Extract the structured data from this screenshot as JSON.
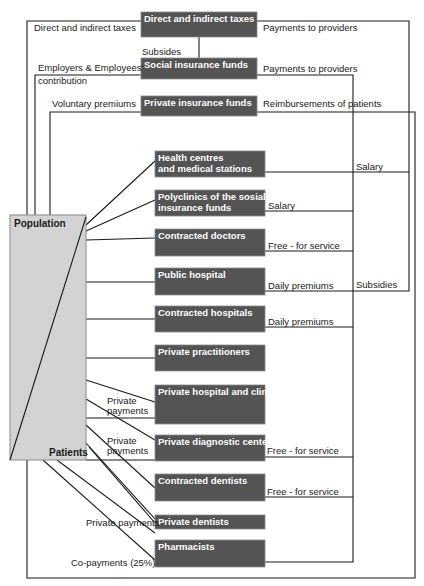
{
  "colors": {
    "box": "#545454",
    "box_border": "#8a8a8a",
    "population_fill": "#d3d3d3",
    "line": "#1a1a1a"
  },
  "population": {
    "top_label": "Population",
    "bottom_label": "Patients",
    "x": 10,
    "y": 215,
    "w": 76,
    "h": 245
  },
  "funding_boxes": [
    {
      "id": "taxes",
      "label": "Direct and indirect taxes",
      "x": 141,
      "y": 12,
      "w": 116,
      "h": 25
    },
    {
      "id": "social",
      "label": "Social insurance funds",
      "x": 141,
      "y": 58,
      "w": 116,
      "h": 21
    },
    {
      "id": "private_ins",
      "label": "Private insurance funds",
      "x": 141,
      "y": 96,
      "w": 116,
      "h": 20
    }
  ],
  "provider_boxes": [
    {
      "id": "health_centres",
      "lines": [
        "Health centres",
        "and medical stations"
      ],
      "x": 155,
      "y": 151,
      "w": 110,
      "h": 26
    },
    {
      "id": "polyclinics",
      "lines": [
        "Polyclinics of the sosial",
        "insurance funds"
      ],
      "x": 155,
      "y": 190,
      "w": 110,
      "h": 26
    },
    {
      "id": "contracted_doctors",
      "lines": [
        "Contracted doctors"
      ],
      "x": 155,
      "y": 229,
      "w": 110,
      "h": 27
    },
    {
      "id": "public_hospital",
      "lines": [
        "Public hospital"
      ],
      "x": 155,
      "y": 268,
      "w": 110,
      "h": 27
    },
    {
      "id": "contracted_hospitals",
      "lines": [
        "Contracted hospitals"
      ],
      "x": 155,
      "y": 306,
      "w": 110,
      "h": 26
    },
    {
      "id": "private_practitioners",
      "lines": [
        "Private practitioners"
      ],
      "x": 155,
      "y": 345,
      "w": 110,
      "h": 26
    },
    {
      "id": "private_hospital",
      "lines": [
        "Private hospital and clinics"
      ],
      "x": 155,
      "y": 385,
      "w": 110,
      "h": 39
    },
    {
      "id": "private_diagnostic",
      "lines": [
        "Private diagnostic centers"
      ],
      "x": 155,
      "y": 435,
      "w": 110,
      "h": 26
    },
    {
      "id": "contracted_dentists",
      "lines": [
        "Contracted dentists"
      ],
      "x": 155,
      "y": 474,
      "w": 110,
      "h": 27
    },
    {
      "id": "private_dentists",
      "lines": [
        "Private dentists"
      ],
      "x": 155,
      "y": 515,
      "w": 110,
      "h": 14
    },
    {
      "id": "pharmacists",
      "lines": [
        "Pharmacists"
      ],
      "x": 155,
      "y": 540,
      "w": 110,
      "h": 27
    }
  ],
  "edge_labels": [
    {
      "id": "lbl-direct-taxes",
      "text": "Direct and indirect taxes",
      "x": 34,
      "y": 31
    },
    {
      "id": "lbl-payments-providers-1",
      "text": "Payments to providers",
      "x": 263,
      "y": 31
    },
    {
      "id": "lbl-subsides",
      "text": "Subsides",
      "x": 142,
      "y": 55
    },
    {
      "id": "lbl-employers",
      "text": "Employers & Employees'",
      "x": 38,
      "y": 71
    },
    {
      "id": "lbl-contribution",
      "text": "contribution",
      "x": 38,
      "y": 84
    },
    {
      "id": "lbl-payments-providers-2",
      "text": "Payments to providers",
      "x": 263,
      "y": 72
    },
    {
      "id": "lbl-voluntary",
      "text": "Voluntary premiums",
      "x": 52,
      "y": 107
    },
    {
      "id": "lbl-reimbursements",
      "text": "Reimbursements of patients",
      "x": 263,
      "y": 107
    },
    {
      "id": "lbl-salary-1",
      "text": "Salary",
      "x": 356,
      "y": 170
    },
    {
      "id": "lbl-salary-2",
      "text": "Salary",
      "x": 268,
      "y": 209
    },
    {
      "id": "lbl-fee-1",
      "text": "Free - for service",
      "x": 268,
      "y": 249
    },
    {
      "id": "lbl-daily-1",
      "text": "Daily premiums",
      "x": 268,
      "y": 289
    },
    {
      "id": "lbl-subsidies",
      "text": "Subsidies",
      "x": 356,
      "y": 288
    },
    {
      "id": "lbl-daily-2",
      "text": "Daily premiums",
      "x": 268,
      "y": 325
    },
    {
      "id": "lbl-private-pay-1a",
      "text": "Private",
      "x": 107,
      "y": 404
    },
    {
      "id": "lbl-private-pay-1b",
      "text": "payments",
      "x": 107,
      "y": 414
    },
    {
      "id": "lbl-private-pay-2a",
      "text": "Private",
      "x": 107,
      "y": 444
    },
    {
      "id": "lbl-private-pay-2b",
      "text": "payments",
      "x": 107,
      "y": 454
    },
    {
      "id": "lbl-fee-2",
      "text": "Free - for service",
      "x": 267,
      "y": 454
    },
    {
      "id": "lbl-fee-3",
      "text": "Free - for service",
      "x": 267,
      "y": 495
    },
    {
      "id": "lbl-private-pay-3",
      "text": "Private payments",
      "x": 86,
      "y": 526
    },
    {
      "id": "lbl-copay",
      "text": "Co-payments (25%)",
      "x": 71,
      "y": 566
    }
  ],
  "lines": [
    "M27,460 L27,21 L141,21",
    "M257,21 L409,21 L409,291 L265,291",
    "M199,37 L199,58",
    "M35,215 L35,75 L141,75",
    "M257,75 L353,75 L353,562 L265,562",
    "M50,215 L50,112 L141,112",
    "M257,112 L415,112 L415,578 L27,578 L27,460",
    "M265,172 L409,172",
    "M265,211 L353,211",
    "M265,251 L353,251",
    "M265,327 L353,327",
    "M265,457 L353,457",
    "M265,497 L353,497",
    "M86,225 L155,161",
    "M86,231 L155,200",
    "M86,240 L155,238",
    "M86,282 L155,282",
    "M86,319 L155,319",
    "M86,358 L155,358",
    "M86,380 L155,402",
    "M86,418 L155,418",
    "M86,399 L155,440",
    "M86,460 L155,460",
    "M86,425 L155,488",
    "M86,443 L155,519",
    "M89,447 L155,523",
    "M57,460 L155,533",
    "M43,460 L155,560"
  ],
  "population_diagonal": "M10,460 L86,217"
}
